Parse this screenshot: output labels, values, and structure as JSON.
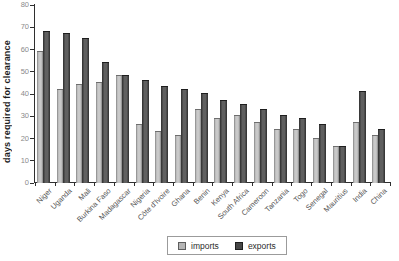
{
  "chart_data": {
    "type": "bar",
    "title": "",
    "xlabel": "",
    "ylabel": "days required for clearance",
    "ylim": [
      0,
      80
    ],
    "ytick_step": 10,
    "grid": false,
    "legend_position": "bottom-center",
    "categories": [
      "Niger",
      "Uganda",
      "Mali",
      "Burkina Faso",
      "Madagascar",
      "Nigeria",
      "Côte d'Ivoire",
      "Ghana",
      "Benin",
      "Kenya",
      "South Africa",
      "Cameroon",
      "Tanzania",
      "Togo",
      "Senegal",
      "Mauritius",
      "India",
      "China"
    ],
    "series": [
      {
        "name": "imports",
        "color": "#b5b5b5",
        "values": [
          59,
          42,
          44,
          45,
          48,
          26,
          23,
          21,
          33,
          29,
          30,
          27,
          24,
          24,
          20,
          16,
          27,
          21
        ]
      },
      {
        "name": "exports",
        "color": "#474747",
        "values": [
          68,
          67,
          65,
          54,
          48,
          46,
          43,
          42,
          40,
          37,
          35,
          33,
          30,
          29,
          26,
          16,
          41,
          24
        ]
      }
    ]
  },
  "colors": {
    "axis": "#2f2f2f",
    "ytick_label": "#8a8a8a",
    "xtick_label": "#565656",
    "background": "#ffffff"
  },
  "legend": {
    "items": [
      {
        "label": "imports"
      },
      {
        "label": "exports"
      }
    ]
  }
}
